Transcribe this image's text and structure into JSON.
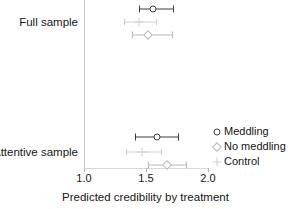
{
  "chart_data": {
    "type": "scatter",
    "subtype": "coefficient-plot-with-error-bars",
    "title": "",
    "xlabel": "Predicted credibility by treatment",
    "ylabel": "",
    "xlim": [
      1.0,
      2.0
    ],
    "xticks": [
      1.0,
      1.5,
      2.0
    ],
    "xtick_labels": [
      "1.0",
      "1.5",
      "2.0"
    ],
    "grid": false,
    "legend_position": "right",
    "groups": [
      "Full sample",
      "Attentive sample"
    ],
    "series": [
      {
        "name": "Meddling",
        "marker": "open-circle",
        "color": "#3f3f3f",
        "points": [
          {
            "group": "Full sample",
            "estimate": 1.56,
            "ci_low": 1.44,
            "ci_high": 1.72
          },
          {
            "group": "Attentive sample",
            "estimate": 1.59,
            "ci_low": 1.41,
            "ci_high": 1.76
          }
        ]
      },
      {
        "name": "No meddling",
        "marker": "open-diamond",
        "color": "#b9b9b9",
        "points": [
          {
            "group": "Full sample",
            "estimate": 1.52,
            "ci_low": 1.39,
            "ci_high": 1.71
          },
          {
            "group": "Attentive sample",
            "estimate": 1.67,
            "ci_low": 1.52,
            "ci_high": 1.82
          }
        ]
      },
      {
        "name": "Control",
        "marker": "plus",
        "color": "#cfcfcf",
        "points": [
          {
            "group": "Full sample",
            "estimate": 1.44,
            "ci_low": 1.32,
            "ci_high": 1.58
          },
          {
            "group": "Attentive sample",
            "estimate": 1.47,
            "ci_low": 1.34,
            "ci_high": 1.62
          }
        ]
      }
    ]
  },
  "axis": {
    "x_title": "Predicted credibility by treatment",
    "ticks": [
      {
        "label": "1.0",
        "value": 1.0
      },
      {
        "label": "1.5",
        "value": 1.5
      },
      {
        "label": "2.0",
        "value": 2.0
      }
    ]
  },
  "groups": [
    {
      "label": "Full sample"
    },
    {
      "label": "Attentive sample"
    }
  ],
  "legend": {
    "items": [
      {
        "label": "Meddling",
        "marker": "open-circle-icon",
        "color": "#3f3f3f"
      },
      {
        "label": "No meddling",
        "marker": "open-diamond-icon",
        "color": "#b9b9b9"
      },
      {
        "label": "Control",
        "marker": "plus-icon",
        "color": "#cfcfcf"
      }
    ]
  },
  "rows": [
    {
      "group": "Full sample",
      "series": "Meddling",
      "estimate": 1.56,
      "ci_low": 1.44,
      "ci_high": 1.72,
      "y": 9,
      "marker": "open-circle",
      "color": "#3f3f3f"
    },
    {
      "group": "Full sample",
      "series": "Control",
      "estimate": 1.44,
      "ci_low": 1.32,
      "ci_high": 1.58,
      "y": 22,
      "marker": "plus",
      "color": "#cfcfcf"
    },
    {
      "group": "Full sample",
      "series": "No meddling",
      "estimate": 1.52,
      "ci_low": 1.39,
      "ci_high": 1.71,
      "y": 35,
      "marker": "open-diamond",
      "color": "#b9b9b9"
    },
    {
      "group": "Attentive sample",
      "series": "Meddling",
      "estimate": 1.59,
      "ci_low": 1.41,
      "ci_high": 1.76,
      "y": 137,
      "marker": "open-circle",
      "color": "#3f3f3f"
    },
    {
      "group": "Attentive sample",
      "series": "Control",
      "estimate": 1.47,
      "ci_low": 1.34,
      "ci_high": 1.62,
      "y": 152,
      "marker": "plus",
      "color": "#cfcfcf"
    },
    {
      "group": "Attentive sample",
      "series": "No meddling",
      "estimate": 1.67,
      "ci_low": 1.52,
      "ci_high": 1.82,
      "y": 165,
      "marker": "open-diamond",
      "color": "#b9b9b9"
    }
  ],
  "group_label_positions": [
    {
      "label": "Full sample",
      "y": 22
    },
    {
      "label": "Attentive sample",
      "y": 152
    }
  ]
}
